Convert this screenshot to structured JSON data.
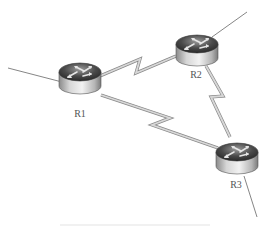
{
  "diagram": {
    "type": "network-topology",
    "routers": [
      {
        "id": "R1",
        "label": "R1",
        "cx": 80,
        "cy": 78
      },
      {
        "id": "R2",
        "label": "R2",
        "cx": 197,
        "cy": 50
      },
      {
        "id": "R3",
        "label": "R3",
        "cx": 237,
        "cy": 158
      }
    ],
    "serial_links": [
      {
        "from": "R1",
        "to": "R2"
      },
      {
        "from": "R1",
        "to": "R3"
      },
      {
        "from": "R2",
        "to": "R3"
      }
    ],
    "external_links": [
      {
        "router": "R1",
        "direction": "left"
      },
      {
        "router": "R2",
        "direction": "upper-right"
      },
      {
        "router": "R3",
        "direction": "down"
      }
    ],
    "caption": ""
  }
}
